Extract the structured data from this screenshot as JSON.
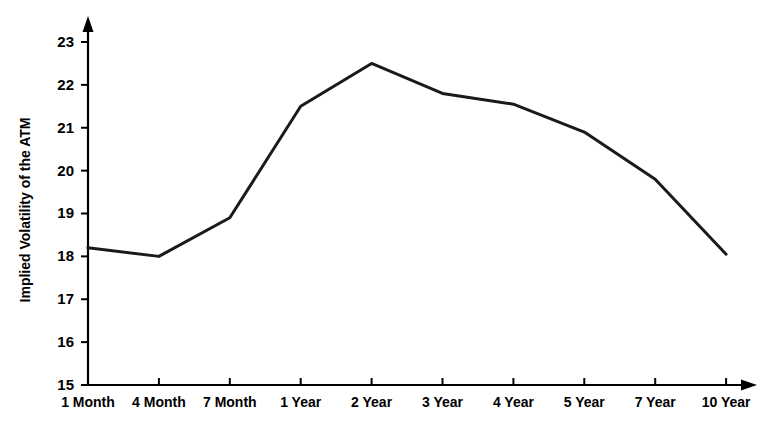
{
  "chart_data": {
    "type": "line",
    "title": "",
    "xlabel": "",
    "ylabel": "Implied Volatility of the ATM",
    "categories": [
      "1 Month",
      "4 Month",
      "7 Month",
      "1 Year",
      "2 Year",
      "3 Year",
      "4 Year",
      "5 Year",
      "7 Year",
      "10 Year"
    ],
    "values": [
      18.2,
      18.0,
      18.9,
      21.5,
      22.5,
      21.8,
      21.55,
      20.9,
      19.8,
      18.05
    ],
    "series": [
      {
        "name": "Implied Volatility of the ATM",
        "values": [
          18.2,
          18.0,
          18.9,
          21.5,
          22.5,
          21.8,
          21.55,
          20.9,
          19.8,
          18.05
        ]
      }
    ],
    "ylim": [
      15,
      23
    ],
    "yticks": [
      15,
      16,
      17,
      18,
      19,
      20,
      21,
      22,
      23
    ],
    "ytick_labels": [
      "15",
      "16",
      "17",
      "18",
      "19",
      "20",
      "21",
      "22",
      "23"
    ],
    "grid": false,
    "legend": "none",
    "line_color": "#1a1a1a",
    "axis_color": "#000000",
    "background_color": "#ffffff"
  }
}
